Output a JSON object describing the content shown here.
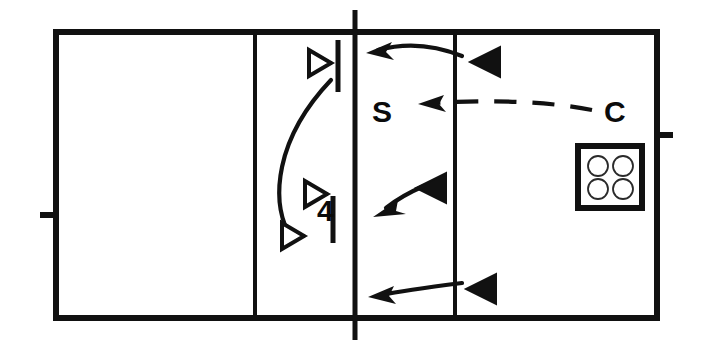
{
  "diagram": {
    "background_color": "#ffffff",
    "line_color": "#111111",
    "court": {
      "left": 56,
      "top": 32,
      "right": 657,
      "bottom": 318,
      "border_width": 6,
      "attack_line_left_x": 255,
      "attack_line_right_x": 455,
      "center_line_x": 355,
      "center_line_top": 10,
      "center_line_bottom": 340,
      "inner_line_width": 4,
      "left_antenna_tick_y": 215,
      "right_antenna_tick_y": 135,
      "tick_length": 16
    },
    "labels": [
      {
        "name": "setter-label",
        "text": "S",
        "x": 372,
        "y": 122,
        "size": 30
      },
      {
        "name": "coach-label",
        "text": "C",
        "x": 604,
        "y": 122,
        "size": 30
      },
      {
        "name": "player-number-label",
        "text": "4",
        "x": 317,
        "y": 221,
        "size": 30
      }
    ],
    "hollow_players": [
      {
        "name": "hollow-player-top",
        "x": 309,
        "y": 63,
        "size": 13
      },
      {
        "name": "hollow-player-middle",
        "x": 305,
        "y": 194,
        "size": 13
      },
      {
        "name": "hollow-player-bottom",
        "x": 282,
        "y": 236,
        "size": 13
      }
    ],
    "filled_players": [
      {
        "name": "filled-player-top",
        "x": 485,
        "y": 62,
        "size": 15
      },
      {
        "name": "filled-player-middle",
        "x": 431,
        "y": 188,
        "size": 15
      },
      {
        "name": "filled-player-bottom",
        "x": 481,
        "y": 289,
        "size": 15
      }
    ],
    "vertical_bars": [
      {
        "name": "target-bar-top",
        "x": 338,
        "y1": 40,
        "y2": 92
      },
      {
        "name": "target-bar-middle",
        "x": 333,
        "y1": 196,
        "y2": 243
      }
    ],
    "arc": {
      "name": "player-movement-arc",
      "path": "M 288 232 C 272 200, 274 140, 331 80"
    },
    "arrows": [
      {
        "name": "ball-path-top",
        "path": "M 462 56 C 430 43, 400 44, 378 50",
        "head": {
          "x": 370,
          "y": 52,
          "angle": 196
        }
      },
      {
        "name": "ball-path-middle",
        "path": "M 424 186 C 410 192, 396 200, 386 208",
        "head": {
          "x": 378,
          "y": 212,
          "angle": 212
        }
      },
      {
        "name": "ball-path-bottom",
        "path": "M 462 283 C 430 287, 400 291, 382 295",
        "head": {
          "x": 372,
          "y": 296,
          "angle": 190
        }
      }
    ],
    "dashed_arrow": {
      "name": "coach-toss-path",
      "path": "M 592 110 C 540 100, 480 100, 435 103",
      "head": {
        "x": 422,
        "y": 104,
        "angle": 189
      }
    },
    "ball_cart": {
      "name": "ball-cart",
      "x": 578,
      "y": 146,
      "width": 64,
      "height": 62,
      "balls": [
        {
          "cx": 598,
          "cy": 166,
          "r": 10
        },
        {
          "cx": 623,
          "cy": 166,
          "r": 10
        },
        {
          "cx": 598,
          "cy": 189,
          "r": 10
        },
        {
          "cx": 623,
          "cy": 189,
          "r": 10
        }
      ]
    }
  }
}
